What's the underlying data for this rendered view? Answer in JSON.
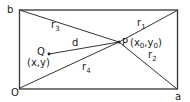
{
  "diagram": {
    "colors": {
      "stroke": "#333333",
      "text": "#222222",
      "background": "#ffffff"
    },
    "corners": {
      "b": {
        "label": "b",
        "x": 19,
        "y": 10
      },
      "top_right": {
        "label": "",
        "x": 178,
        "y": 10
      },
      "O": {
        "label": "O",
        "x": 20,
        "y": 88
      },
      "a": {
        "label": "a",
        "x": 177,
        "y": 89
      }
    },
    "points": {
      "P": {
        "label": "P",
        "coords_label": "(x",
        "sub0": "0",
        "comma": ",y",
        "sub1": "0",
        "close": ")",
        "x": 119,
        "y": 42
      },
      "Q": {
        "label": "Q",
        "coords_label": "(x,y)",
        "x": 49,
        "y": 54
      }
    },
    "segments": {
      "r1": {
        "label": "r",
        "sub": "1"
      },
      "r2": {
        "label": "r",
        "sub": "2"
      },
      "r3": {
        "label": "r",
        "sub": "3"
      },
      "r4": {
        "label": "r",
        "sub": "4"
      },
      "d": {
        "label": "d"
      }
    }
  }
}
